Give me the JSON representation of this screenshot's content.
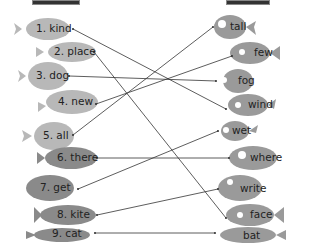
{
  "left_fish": [
    {
      "label": "1. kind",
      "x": 22,
      "y": 16
    },
    {
      "label": "2. place",
      "x": 42,
      "y": 40
    },
    {
      "label": "3. dog",
      "x": 27,
      "y": 63
    },
    {
      "label": "4. new",
      "x": 44,
      "y": 88
    },
    {
      "label": "5. all",
      "x": 23,
      "y": 122
    },
    {
      "label": "6. there",
      "x": 45,
      "y": 145
    },
    {
      "label": "7. get",
      "x": 28,
      "y": 173
    },
    {
      "label": "8. kite",
      "x": 40,
      "y": 203
    },
    {
      "label": "9. cat",
      "x": 28,
      "y": 227
    }
  ],
  "right_fish": [
    {
      "label": "tall",
      "x": 212,
      "y": 13
    },
    {
      "label": "few",
      "x": 232,
      "y": 40
    },
    {
      "label": "fog",
      "x": 221,
      "y": 64
    },
    {
      "label": "wind",
      "x": 229,
      "y": 91
    },
    {
      "label": "wet",
      "x": 220,
      "y": 120
    },
    {
      "label": "where",
      "x": 235,
      "y": 144
    },
    {
      "label": "write",
      "x": 220,
      "y": 175
    },
    {
      "label": "face",
      "x": 230,
      "y": 205
    },
    {
      "label": "bat",
      "x": 220,
      "y": 228
    }
  ],
  "matches": [
    {
      "from": "1. kind",
      "to": "wind"
    },
    {
      "from": "2. place",
      "to": "face"
    },
    {
      "from": "3. dog",
      "to": "fog"
    },
    {
      "from": "4. new",
      "to": "few"
    },
    {
      "from": "5. all",
      "to": "tall"
    },
    {
      "from": "6. there",
      "to": "where"
    },
    {
      "from": "7. get",
      "to": "wet"
    },
    {
      "from": "8. kite",
      "to": "write"
    },
    {
      "from": "9. cat",
      "to": "bat"
    }
  ],
  "colors": {
    "fish_light": "#b8b8b8",
    "fish_dark": "#8a8a8a",
    "line": "#333333",
    "text": "#222222"
  }
}
